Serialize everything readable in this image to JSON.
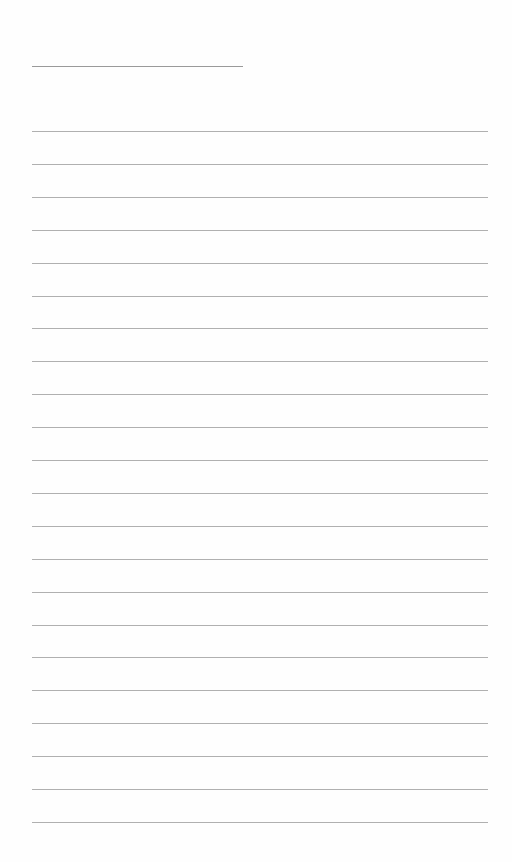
{
  "page": {
    "type": "blank lined paper",
    "title_line": {
      "x": 32,
      "y": 66,
      "width": 211,
      "color": "#9a9a9a"
    },
    "rules": {
      "count": 22,
      "first_y": 131,
      "spacing": 32.9,
      "x": 32,
      "width": 456,
      "color": "#b0b0b0"
    },
    "background": "#fefefe"
  }
}
